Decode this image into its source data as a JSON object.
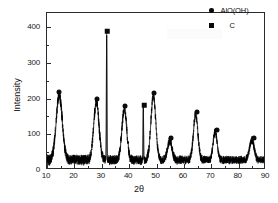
{
  "chart_data": {
    "type": "line",
    "title": "",
    "xlabel": "2θ",
    "ylabel": "Intensity",
    "xlim": [
      10,
      90
    ],
    "ylim": [
      0,
      440
    ],
    "xticks": [
      10,
      20,
      30,
      40,
      50,
      60,
      70,
      80,
      90
    ],
    "xticklabels": [
      "10",
      "20",
      "30",
      "40",
      "50",
      "60",
      "70",
      "80",
      "90"
    ],
    "yticks": [
      0,
      100,
      200,
      300,
      400
    ],
    "yticklabels": [
      "0",
      "100",
      "200",
      "300",
      "400"
    ],
    "grid": false,
    "legend_position": "top-right",
    "legend": [
      {
        "marker": "circle",
        "label": "AlO(OH)"
      },
      {
        "marker": "square",
        "label": "C"
      }
    ],
    "series": [
      {
        "name": "XRD pattern",
        "description": "noisy diffraction trace with labelled Bragg peaks",
        "baseline": 22,
        "noise_amplitude": 16,
        "color": "#000000"
      }
    ],
    "peaks": [
      {
        "two_theta": 14.5,
        "intensity": 207,
        "marker": "circle",
        "phase": "AlO(OH)",
        "width": 1.5
      },
      {
        "two_theta": 28.2,
        "intensity": 187,
        "marker": "circle",
        "phase": "AlO(OH)",
        "width": 1.3
      },
      {
        "two_theta": 32.0,
        "intensity": 377,
        "marker": "square",
        "phase": "C",
        "width": 0.16
      },
      {
        "two_theta": 38.5,
        "intensity": 168,
        "marker": "circle",
        "phase": "AlO(OH)",
        "width": 1.2
      },
      {
        "two_theta": 45.5,
        "intensity": 170,
        "marker": "square",
        "phase": "C",
        "width": 0.16
      },
      {
        "two_theta": 49.2,
        "intensity": 205,
        "marker": "circle",
        "phase": "AlO(OH)",
        "width": 1.2
      },
      {
        "two_theta": 55.3,
        "intensity": 78,
        "marker": "circle",
        "phase": "AlO(OH)",
        "width": 1.1
      },
      {
        "two_theta": 64.8,
        "intensity": 151,
        "marker": "circle",
        "phase": "AlO(OH)",
        "width": 1.1
      },
      {
        "two_theta": 72.0,
        "intensity": 102,
        "marker": "circle",
        "phase": "AlO(OH)",
        "width": 1.0
      },
      {
        "two_theta": 85.5,
        "intensity": 79,
        "marker": "circle",
        "phase": "AlO(OH)",
        "width": 1.1
      }
    ],
    "colors": {
      "trace": "#000000",
      "axis": "#2b2b2b",
      "marker": "#0a0a0a",
      "background": "#ffffff"
    }
  },
  "watermark": {
    "text": ""
  }
}
